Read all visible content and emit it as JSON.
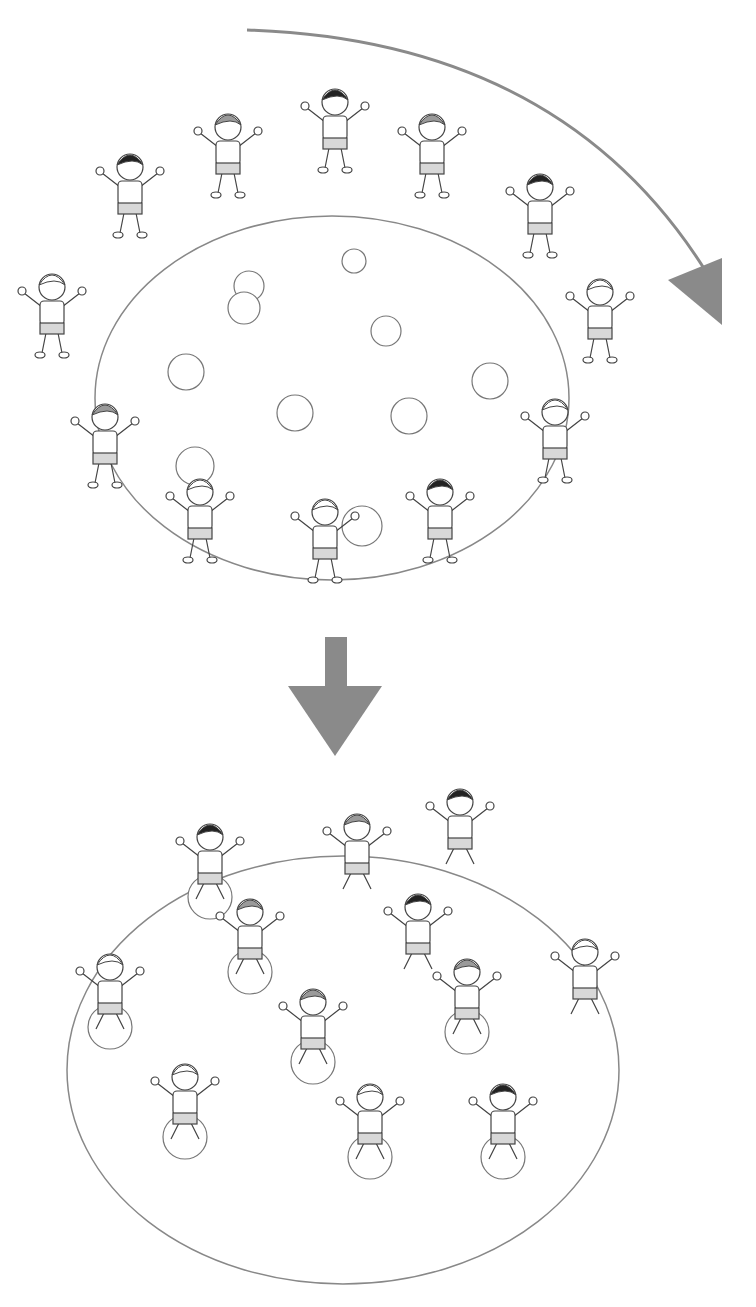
{
  "colors": {
    "line": "#888888",
    "arrow": "#8a8a8a",
    "outline": "#444444",
    "shorts": "#d8d8d8",
    "hair_dark": "#222222",
    "hair_gray": "#9a9a9a",
    "ball_fill": "#ffffff"
  },
  "scene1": {
    "description": "children standing in circle around balls",
    "ellipse": {
      "cx": 332,
      "cy": 398,
      "rx": 237,
      "ry": 182
    },
    "balls": [
      {
        "cx": 354,
        "cy": 261,
        "r": 12
      },
      {
        "cx": 249,
        "cy": 286,
        "r": 15
      },
      {
        "cx": 244,
        "cy": 308,
        "r": 16
      },
      {
        "cx": 386,
        "cy": 331,
        "r": 15
      },
      {
        "cx": 186,
        "cy": 372,
        "r": 18
      },
      {
        "cx": 490,
        "cy": 381,
        "r": 18
      },
      {
        "cx": 295,
        "cy": 413,
        "r": 18
      },
      {
        "cx": 409,
        "cy": 416,
        "r": 18
      },
      {
        "cx": 195,
        "cy": 466,
        "r": 19
      },
      {
        "cx": 362,
        "cy": 526,
        "r": 20
      }
    ],
    "children": [
      {
        "x": 52,
        "y": 285,
        "hair": "light"
      },
      {
        "x": 130,
        "y": 165,
        "hair": "dark"
      },
      {
        "x": 228,
        "y": 125,
        "hair": "gray"
      },
      {
        "x": 335,
        "y": 100,
        "hair": "dark"
      },
      {
        "x": 432,
        "y": 125,
        "hair": "gray"
      },
      {
        "x": 540,
        "y": 185,
        "hair": "dark"
      },
      {
        "x": 600,
        "y": 290,
        "hair": "light"
      },
      {
        "x": 105,
        "y": 415,
        "hair": "gray"
      },
      {
        "x": 555,
        "y": 410,
        "hair": "light"
      },
      {
        "x": 200,
        "y": 490,
        "hair": "light"
      },
      {
        "x": 325,
        "y": 510,
        "hair": "light"
      },
      {
        "x": 440,
        "y": 490,
        "hair": "dark"
      }
    ]
  },
  "curved_arrow": {
    "path": "M247,30 Q560,40 705,270",
    "head": "668,280 722,258 722,325"
  },
  "down_arrow": {
    "shaft": {
      "x": 325,
      "y": 637,
      "w": 22,
      "h": 50
    },
    "head": "288,686 382,686 335,756"
  },
  "scene2": {
    "description": "children sitting on balls inside circle",
    "ellipse": {
      "cx": 343,
      "cy": 1070,
      "rx": 276,
      "ry": 214
    },
    "children": [
      {
        "x": 210,
        "y": 835,
        "hair": "dark",
        "ball": true
      },
      {
        "x": 357,
        "y": 825,
        "hair": "gray",
        "ball": false
      },
      {
        "x": 460,
        "y": 800,
        "hair": "dark",
        "ball": false
      },
      {
        "x": 250,
        "y": 910,
        "hair": "gray",
        "ball": true
      },
      {
        "x": 418,
        "y": 905,
        "hair": "dark",
        "ball": false
      },
      {
        "x": 110,
        "y": 965,
        "hair": "light",
        "ball": true
      },
      {
        "x": 313,
        "y": 1000,
        "hair": "gray",
        "ball": true
      },
      {
        "x": 467,
        "y": 970,
        "hair": "gray",
        "ball": true
      },
      {
        "x": 585,
        "y": 950,
        "hair": "light",
        "ball": false
      },
      {
        "x": 185,
        "y": 1075,
        "hair": "light",
        "ball": true
      },
      {
        "x": 370,
        "y": 1095,
        "hair": "light",
        "ball": true
      },
      {
        "x": 503,
        "y": 1095,
        "hair": "dark",
        "ball": true
      }
    ]
  }
}
